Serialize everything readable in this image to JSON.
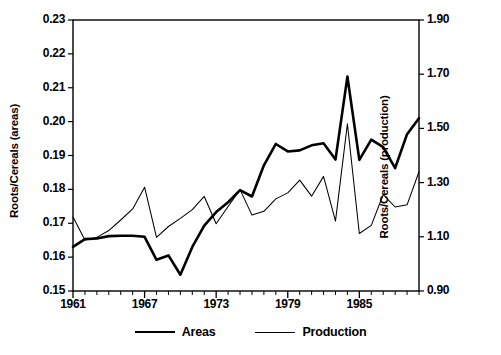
{
  "chart_data": {
    "type": "line",
    "title": "",
    "xlabel": "",
    "ylabel": "Roots/Cereals (areas)",
    "ylabel_right": "Roots/Cereals (production)",
    "xlim": [
      1961,
      1990
    ],
    "ylim": [
      0.15,
      0.23
    ],
    "ylim_right": [
      0.9,
      1.9
    ],
    "xticks": [
      1961,
      1967,
      1973,
      1979,
      1985
    ],
    "xtick_labels": [
      "1961",
      "1967",
      "1973",
      "1979",
      "1985"
    ],
    "xminor_tick_interval": 1,
    "yticks": [
      0.15,
      0.16,
      0.17,
      0.18,
      0.19,
      0.2,
      0.21,
      0.22,
      0.23
    ],
    "ytick_labels": [
      "0.15",
      "0.16",
      "0.17",
      "0.18",
      "0.19",
      "0.20",
      "0.21",
      "0.22",
      "0.23"
    ],
    "yticks_right": [
      0.9,
      1.1,
      1.3,
      1.5,
      1.7,
      1.9
    ],
    "ytick_labels_right": [
      "0.90",
      "1.10",
      "1.30",
      "1.50",
      "1.70",
      "1.90"
    ],
    "grid": false,
    "legend_position": "below-center",
    "x": [
      1961,
      1962,
      1963,
      1964,
      1965,
      1966,
      1967,
      1968,
      1969,
      1970,
      1971,
      1972,
      1973,
      1974,
      1975,
      1976,
      1977,
      1978,
      1979,
      1980,
      1981,
      1982,
      1983,
      1984,
      1985,
      1986,
      1987,
      1988,
      1989,
      1990
    ],
    "series": [
      {
        "name": "Areas",
        "axis": "left",
        "line_width": "thick",
        "color": "#000000",
        "values": [
          0.163,
          0.1653,
          0.1655,
          0.1662,
          0.1663,
          0.1663,
          0.166,
          0.1592,
          0.1605,
          0.1548,
          0.163,
          0.1693,
          0.1733,
          0.1762,
          0.1798,
          0.1779,
          0.1871,
          0.1934,
          0.1912,
          0.1915,
          0.193,
          0.1936,
          0.1888,
          0.2133,
          0.1887,
          0.1947,
          0.1925,
          0.1863,
          0.1963,
          0.201
        ]
      },
      {
        "name": "Production",
        "axis": "right",
        "line_width": "thin",
        "color": "#000000",
        "values": [
          1.173,
          1.088,
          1.098,
          1.123,
          1.162,
          1.203,
          1.283,
          1.098,
          1.138,
          1.168,
          1.2,
          1.249,
          1.148,
          1.212,
          1.274,
          1.18,
          1.194,
          1.24,
          1.262,
          1.309,
          1.25,
          1.323,
          1.158,
          1.517,
          1.112,
          1.142,
          1.256,
          1.21,
          1.218,
          1.34
        ]
      }
    ]
  },
  "axes": {
    "left_label": "Roots/Cereals (areas)",
    "right_label": "Roots/Cereals (production)"
  },
  "legend": {
    "items": [
      {
        "label": "Areas",
        "style": "thick"
      },
      {
        "label": "Production",
        "style": "thin"
      }
    ]
  }
}
